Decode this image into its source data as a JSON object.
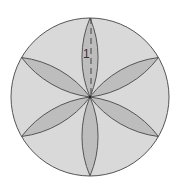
{
  "diagram": {
    "type": "geometric-figure",
    "circle": {
      "cx": 90,
      "cy": 97,
      "r": 79,
      "fill": "#d9d9d9",
      "stroke": "#555555"
    },
    "petals": {
      "count": 6,
      "angles_deg": [
        90,
        30,
        -30,
        -90,
        -150,
        150
      ],
      "arc_radius": 101,
      "fill": "#bdbdbd",
      "stroke": "#555555"
    },
    "radius_marker": {
      "style": "dashed",
      "from": [
        91,
        18
      ],
      "to": [
        91,
        97
      ]
    },
    "label": {
      "text": "1",
      "x": 83,
      "y": 58
    }
  }
}
